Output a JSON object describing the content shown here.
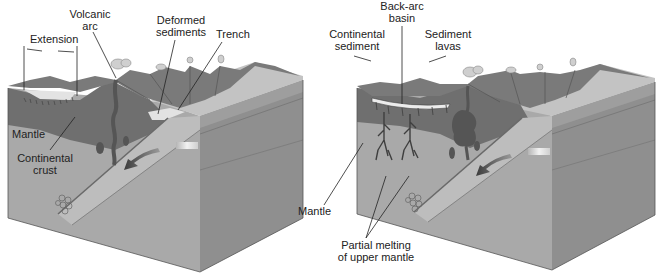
{
  "figure": {
    "panels": [
      {
        "id": "left",
        "description": "Continental-margin subduction with back-arc extension",
        "labels": {
          "extension": "Extension",
          "volcanic_arc": [
            "Volcanic",
            "arc"
          ],
          "deformed_sediments": [
            "Deformed",
            "sediments"
          ],
          "trench": "Trench",
          "mantle": "Mantle",
          "continental_crust": [
            "Continental",
            "crust"
          ]
        }
      },
      {
        "id": "right",
        "description": "Back-arc basin formation with partial melting of upper mantle",
        "labels": {
          "back_arc_basin": [
            "Back-arc",
            "basin"
          ],
          "continental_sediment": [
            "Continental",
            "sediment"
          ],
          "sediment_lavas": [
            "Sediment",
            "lavas"
          ],
          "mantle": "Mantle",
          "partial_melting": [
            "Partial melting",
            "of upper mantle"
          ]
        }
      }
    ],
    "colors": {
      "block_front": "#a9a9a9",
      "block_side": "#8f8f8f",
      "crust": "#6f6f6f",
      "mountains": "#7a7a7a",
      "ocean_top": "#c6c6c6",
      "slab": "#bdbdbd",
      "magma": "#555555",
      "basin": "#e6e6e6",
      "arrow": "#4a4a4a"
    }
  }
}
